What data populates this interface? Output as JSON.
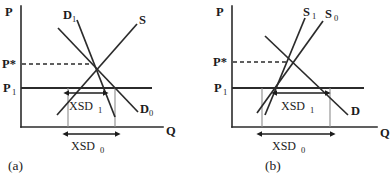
{
  "figure": {
    "type": "economics-supply-demand-diagram",
    "panels": [
      {
        "id": "a",
        "caption": "(a)",
        "axes": {
          "y_label": "P",
          "x_label": "Q"
        },
        "price_labels": {
          "equilibrium": "P*",
          "world": "P",
          "world_sub": "1"
        },
        "curves": [
          {
            "name": "D1",
            "label": "D",
            "sub": "1"
          },
          {
            "name": "S",
            "label": "S",
            "sub": ""
          },
          {
            "name": "D0",
            "label": "D",
            "sub": "0"
          }
        ],
        "measures": [
          {
            "name": "XSD1",
            "label": "XSD",
            "sub": "1"
          },
          {
            "name": "XSD0",
            "label": "XSD",
            "sub": "0"
          }
        ]
      },
      {
        "id": "b",
        "caption": "(b)",
        "axes": {
          "y_label": "P",
          "x_label": "Q"
        },
        "price_labels": {
          "equilibrium": "P*",
          "world": "P",
          "world_sub": "1"
        },
        "curves": [
          {
            "name": "S1",
            "label": "S",
            "sub": "1"
          },
          {
            "name": "S0",
            "label": "S",
            "sub": "0"
          },
          {
            "name": "D",
            "label": "D",
            "sub": ""
          }
        ],
        "measures": [
          {
            "name": "XSD1",
            "label": "XSD",
            "sub": "1"
          },
          {
            "name": "XSD0",
            "label": "XSD",
            "sub": "0"
          }
        ]
      }
    ],
    "colors": {
      "ink": "#1c1c1c",
      "axis": "#2b2b2b",
      "guide": "#8d8d8d",
      "background": "#ffffff"
    }
  }
}
